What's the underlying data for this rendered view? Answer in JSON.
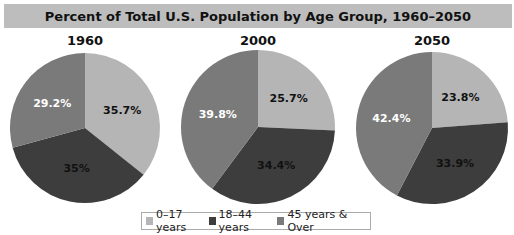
{
  "chart_data": {
    "type": "pie",
    "title": "Percent of Total U.S. Population by Age Group, 1960–2050",
    "legend": [
      "0–17 years",
      "18–44 years",
      "45 years & Over"
    ],
    "legend_position": "bottom",
    "colors": [
      "#b5b5b5",
      "#3d3d3d",
      "#7a7a7a"
    ],
    "charts": [
      {
        "label": "1960",
        "values": [
          35.7,
          35,
          29.2
        ],
        "value_labels": [
          "35.7%",
          "35%",
          "29.2%"
        ]
      },
      {
        "label": "2000",
        "values": [
          25.7,
          34.4,
          39.8
        ],
        "value_labels": [
          "25.7%",
          "34.4%",
          "39.8%"
        ]
      },
      {
        "label": "2050",
        "values": [
          23.8,
          33.9,
          42.4
        ],
        "value_labels": [
          "23.8%",
          "33.9%",
          "42.4%"
        ]
      }
    ]
  }
}
